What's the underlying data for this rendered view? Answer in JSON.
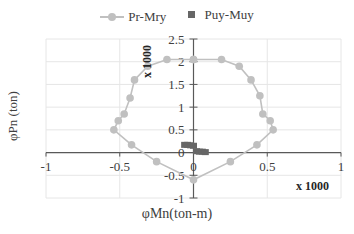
{
  "chart_data": {
    "type": "scatter",
    "title": "",
    "xlabel": "φMn(ton-m)",
    "ylabel": "φPn (ton)",
    "x_multiplier_label": "x 1000",
    "y_multiplier_label": "x 1000",
    "xlim": [
      -1,
      1
    ],
    "ylim": [
      -1,
      2.5
    ],
    "x_ticks": [
      "-1",
      "-0.5",
      "0",
      "0.5",
      "1"
    ],
    "y_ticks": [
      "-1",
      "-0.5",
      "0",
      "0.5",
      "1",
      "1.5",
      "2",
      "2.5"
    ],
    "grid": true,
    "legend_position": "top",
    "series": [
      {
        "name": "Pr-Mry",
        "style": "line-with-circle-markers",
        "color": "#c0c0c0",
        "points": [
          [
            0,
            2.05
          ],
          [
            0.19,
            2.05
          ],
          [
            0.31,
            1.9
          ],
          [
            0.39,
            1.6
          ],
          [
            0.45,
            1.25
          ],
          [
            0.47,
            0.85
          ],
          [
            0.52,
            0.7
          ],
          [
            0.54,
            0.5
          ],
          [
            0.43,
            0.17
          ],
          [
            0.25,
            -0.2
          ],
          [
            0,
            -0.6
          ],
          [
            -0.25,
            -0.2
          ],
          [
            -0.42,
            0.17
          ],
          [
            -0.54,
            0.5
          ],
          [
            -0.51,
            0.7
          ],
          [
            -0.47,
            0.85
          ],
          [
            -0.43,
            1.2
          ],
          [
            -0.4,
            1.6
          ],
          [
            -0.31,
            1.9
          ],
          [
            -0.18,
            2.05
          ],
          [
            0,
            2.05
          ]
        ]
      },
      {
        "name": "Puy-Muy",
        "style": "square-markers",
        "color": "#666666",
        "points": [
          [
            -0.06,
            0.17
          ],
          [
            -0.04,
            0.17
          ],
          [
            -0.02,
            0.16
          ],
          [
            0.0,
            0.15
          ],
          [
            0.02,
            0.03
          ],
          [
            0.04,
            0.02
          ],
          [
            0.06,
            0.02
          ],
          [
            0.08,
            0.01
          ]
        ]
      }
    ]
  },
  "legend": {
    "items": [
      {
        "label": "Pr-Mry"
      },
      {
        "label": "Puy-Muy"
      }
    ]
  }
}
